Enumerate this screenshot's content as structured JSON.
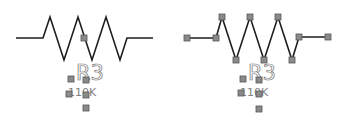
{
  "canvas": {
    "width": 348,
    "height": 125,
    "background": "#ffffff"
  },
  "colors": {
    "wire": "#1e1e1e",
    "handle_fill": "#8a8a8a",
    "handle_stroke": "#555555",
    "label": "#707070"
  },
  "resistors": [
    {
      "id": "left",
      "state": "unselected-path",
      "designator": "R3",
      "value": "110K",
      "path": [
        [
          16,
          38
        ],
        [
          43,
          38
        ],
        [
          50,
          17
        ],
        [
          64,
          60
        ],
        [
          78,
          17
        ],
        [
          92,
          60
        ],
        [
          106,
          17
        ],
        [
          120,
          60
        ],
        [
          127,
          38
        ],
        [
          153,
          38
        ]
      ],
      "path_handles": [],
      "center_handle": [
        84,
        38
      ],
      "label_handles": [
        [
          71,
          79
        ],
        [
          86,
          80
        ],
        [
          69,
          94
        ],
        [
          86,
          95
        ],
        [
          86,
          108
        ]
      ],
      "designator_pos": [
        76,
        80
      ],
      "value_pos": [
        68,
        96
      ]
    },
    {
      "id": "right",
      "state": "selected-path",
      "designator": "R3",
      "value": "110K",
      "path": [
        [
          187,
          38
        ],
        [
          216,
          38
        ],
        [
          222,
          17
        ],
        [
          236,
          60
        ],
        [
          250,
          17
        ],
        [
          264,
          60
        ],
        [
          278,
          17
        ],
        [
          292,
          60
        ],
        [
          299,
          37
        ],
        [
          328,
          37
        ]
      ],
      "path_handles": [
        [
          187,
          38
        ],
        [
          216,
          38
        ],
        [
          222,
          17
        ],
        [
          236,
          60
        ],
        [
          250,
          17
        ],
        [
          264,
          60
        ],
        [
          278,
          17
        ],
        [
          292,
          60
        ],
        [
          299,
          37
        ],
        [
          328,
          37
        ]
      ],
      "center_handle": null,
      "label_handles": [
        [
          243,
          79
        ],
        [
          259,
          80
        ],
        [
          241,
          93
        ],
        [
          259,
          94
        ],
        [
          259,
          109
        ]
      ],
      "designator_pos": [
        248,
        80
      ],
      "value_pos": [
        240,
        96
      ]
    }
  ]
}
